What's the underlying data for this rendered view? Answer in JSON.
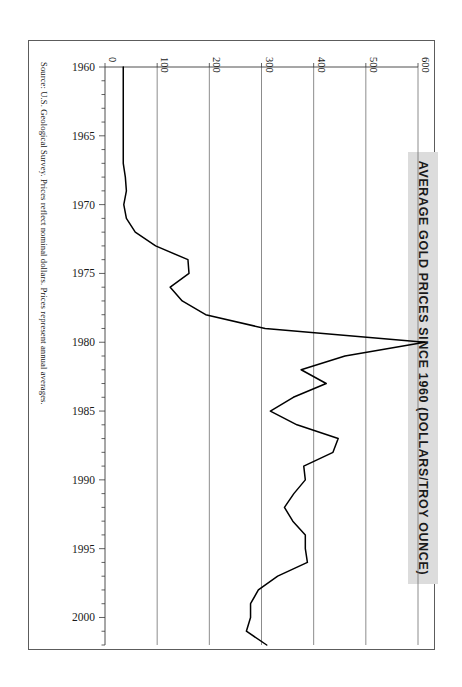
{
  "title": "AVERAGE GOLD PRICES SINCE 1960 (DOLLARS/TROY OUNCE)",
  "source_note": "Source: U.S. Geological Survey.  Prices reflect nominal dollars.  Prices represent annual averages.",
  "colors": {
    "line": "#000000",
    "grid": "#6e6e6e",
    "title_band": "#dcdcdc",
    "frame": "#5c5c5c"
  },
  "chart_data": {
    "type": "line",
    "title": "AVERAGE GOLD PRICES SINCE 1960 (DOLLARS/TROY OUNCE)",
    "orientation": "horizontal-value-axis",
    "xlabel": "",
    "ylabel": "",
    "value_axis": {
      "position": "top",
      "ticks": [
        0,
        100,
        200,
        300,
        400,
        500,
        600
      ],
      "tick_labels": [
        "0",
        "100",
        "200",
        "300",
        "400",
        "500",
        "600"
      ],
      "range": [
        0,
        600
      ],
      "grid": true
    },
    "category_axis": {
      "position": "left",
      "ticks": [
        1960,
        1965,
        1970,
        1975,
        1980,
        1985,
        1990,
        1995,
        2000
      ],
      "tick_labels": [
        "1960",
        "1965",
        "1970",
        "1975",
        "1980",
        "1985",
        "1990",
        "1995",
        "2000"
      ],
      "range": [
        1960,
        2002
      ],
      "minor_tick_step": 1,
      "grid": false
    },
    "legend": null,
    "series": [
      {
        "name": "Average gold price (dollars per troy ounce)",
        "x": [
          1960,
          1961,
          1962,
          1963,
          1964,
          1965,
          1966,
          1967,
          1968,
          1969,
          1970,
          1971,
          1972,
          1973,
          1974,
          1975,
          1976,
          1977,
          1978,
          1979,
          1980,
          1981,
          1982,
          1983,
          1984,
          1985,
          1986,
          1987,
          1988,
          1989,
          1990,
          1991,
          1992,
          1993,
          1994,
          1995,
          1996,
          1997,
          1998,
          1999,
          2000,
          2001,
          2002
        ],
        "y": [
          35,
          35,
          35,
          35,
          35,
          35,
          35,
          35,
          39,
          41,
          36,
          41,
          58,
          97,
          159,
          161,
          125,
          148,
          193,
          307,
          613,
          460,
          376,
          424,
          361,
          317,
          368,
          447,
          437,
          381,
          384,
          362,
          344,
          360,
          384,
          384,
          388,
          331,
          294,
          279,
          279,
          271,
          310
        ]
      }
    ]
  }
}
